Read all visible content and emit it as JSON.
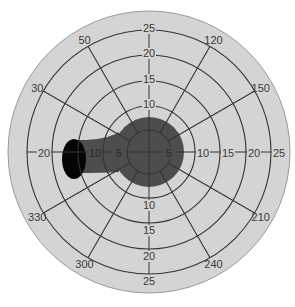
{
  "diagram": {
    "type": "polar-visual-field-chart",
    "center": {
      "x": 149,
      "y": 152
    },
    "disk_radius": 141,
    "colors": {
      "background": "#ffffff",
      "disk": "#d4d4d4",
      "disk_edge": "#9a9a9a",
      "grid": "#333333",
      "defect_region": "#4d4d4d",
      "blind_spot": "#050505"
    },
    "rings": [
      {
        "value": "5",
        "radius": 22
      },
      {
        "value": "10",
        "radius": 46
      },
      {
        "value": "15",
        "radius": 71
      },
      {
        "value": "20",
        "radius": 97
      },
      {
        "value": "25",
        "radius": 122
      }
    ],
    "ring_labels": {
      "top": [
        "10",
        "15",
        "20",
        "25"
      ],
      "bottom": [
        "10",
        "15",
        "20",
        "25"
      ],
      "left": [
        "5",
        "10",
        "20"
      ],
      "right": [
        "5",
        "10",
        "15",
        "20",
        "25"
      ]
    },
    "radials": [
      {
        "label": "120",
        "angle": 30
      },
      {
        "label": "150",
        "angle": 60
      },
      {
        "label": "210",
        "angle": 120
      },
      {
        "label": "240",
        "angle": 150
      },
      {
        "label": "300",
        "angle": 210
      },
      {
        "label": "330",
        "angle": 240
      },
      {
        "label": "30",
        "angle": 300
      },
      {
        "label": "50",
        "angle": 330
      }
    ],
    "central_blob": {
      "cx": 149,
      "cy": 152,
      "r": 35
    },
    "blind_spot": {
      "cx": 74,
      "cy": 159,
      "rx": 12,
      "ry": 20
    },
    "band": {
      "x_left": 74,
      "top": 140,
      "bottom": 173
    }
  }
}
